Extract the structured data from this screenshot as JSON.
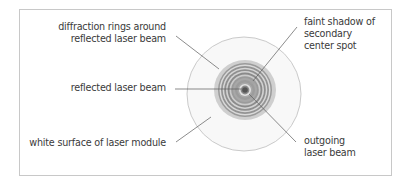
{
  "diagram": {
    "labels": {
      "diffraction_rings_line1": "diffraction rings around",
      "diffraction_rings_line2": "reflected laser beam",
      "reflected_beam": "reflected laser beam",
      "white_surface": "white surface of laser module",
      "faint_shadow_line1": "faint shadow of",
      "faint_shadow_line2": "secondary",
      "faint_shadow_line3": "center spot",
      "outgoing_line1": "outgoing",
      "outgoing_line2": "laser beam"
    },
    "colors": {
      "outer_circle_fill": "#f7f7f7",
      "outer_circle_stroke": "#c4c4c4",
      "halo": "#c9c9c9",
      "ring_dark": "#8e8e8e",
      "ring_light": "#d9d9d9",
      "center_spot": "#555555",
      "leader_line": "#555555",
      "text": "#3a3a3a"
    }
  }
}
